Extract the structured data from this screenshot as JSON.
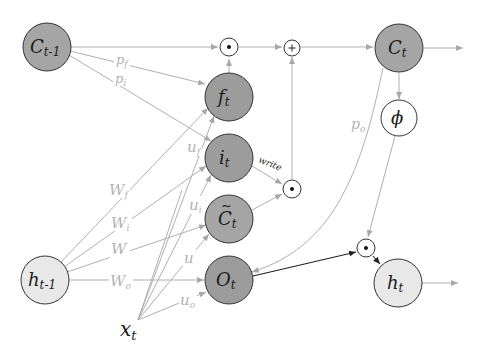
{
  "diagram": {
    "colors": {
      "background": "#ffffff",
      "gate_node_fill": "#9a9a9a",
      "cell_node_fill": "#ababab",
      "hidden_node_fill": "#e6e6e6",
      "node_stroke": "#333333",
      "edge_gray": "#b0b0b0",
      "edge_dark": "#222222",
      "label_gray": "#b3b3b3"
    },
    "nodes": {
      "c_prev": {
        "base": "C",
        "sub": "t-1"
      },
      "f": {
        "base": "f",
        "sub": "t"
      },
      "i": {
        "base": "i",
        "sub": "t"
      },
      "c_tilde": {
        "base": "C",
        "sub": "t",
        "accent": "~"
      },
      "o": {
        "base": "O",
        "sub": "t"
      },
      "c": {
        "base": "C",
        "sub": "t"
      },
      "phi": {
        "base": "ϕ"
      },
      "h_prev": {
        "base": "h",
        "sub": "t-1"
      },
      "h": {
        "base": "h",
        "sub": "t"
      },
      "x": {
        "base": "x",
        "sub": "t"
      }
    },
    "operators": {
      "mul_forget": "⊙",
      "add": "+",
      "mul_input": "⊙",
      "mul_output": "⊙"
    },
    "edge_labels": {
      "pf": {
        "base": "p",
        "sub": "f"
      },
      "pi": {
        "base": "p",
        "sub": "i"
      },
      "po": {
        "base": "p",
        "sub": "o"
      },
      "uf": {
        "base": "u",
        "sub": "f"
      },
      "ui": {
        "base": "u",
        "sub": "i"
      },
      "u": {
        "base": "u"
      },
      "uo": {
        "base": "u",
        "sub": "o"
      },
      "wf": {
        "base": "W",
        "sub": "f"
      },
      "wi": {
        "base": "W",
        "sub": "i"
      },
      "w": {
        "base": "W"
      },
      "wo": {
        "base": "W",
        "sub": "o"
      },
      "write": "write"
    }
  }
}
